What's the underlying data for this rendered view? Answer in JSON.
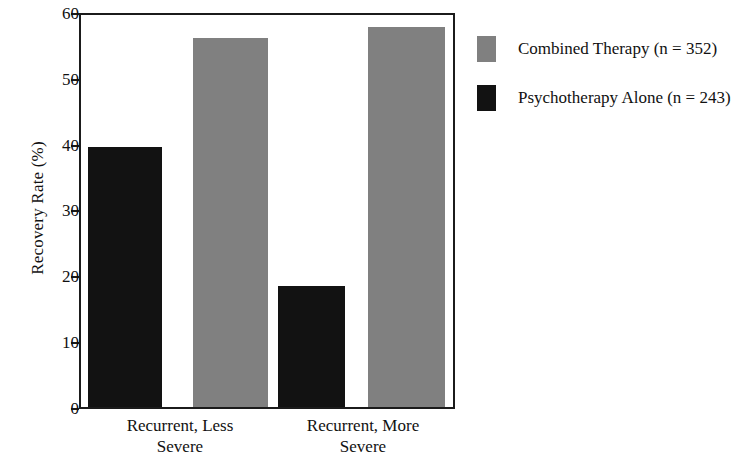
{
  "chart_data": {
    "type": "bar",
    "title": "",
    "xlabel": "",
    "ylabel": "Recovery Rate (%)",
    "categories": [
      "Recurrent, Less Severe",
      "Recurrent, More Severe"
    ],
    "category_lines": [
      [
        "Recurrent, Less",
        "Severe"
      ],
      [
        "Recurrent, More",
        "Severe"
      ]
    ],
    "series": [
      {
        "name": "Combined Therapy (n = 352)",
        "color": "#808080",
        "values": [
          56.5,
          58.2
        ]
      },
      {
        "name": "Psychotherapy Alone (n = 243)",
        "color": "#121212",
        "values": [
          39.8,
          18.5
        ]
      }
    ],
    "ylim": [
      0,
      60
    ],
    "yticks": [
      0,
      10,
      20,
      30,
      40,
      50,
      60
    ],
    "ytick_labels": [
      "0",
      "10",
      "20",
      "30",
      "40",
      "50",
      "60"
    ],
    "grid": false,
    "legend_position": "right",
    "frame": true
  },
  "legend": {
    "entries": [
      {
        "label": "Combined Therapy (n = 352)",
        "swatch": "gray"
      },
      {
        "label": "Psychotherapy Alone (n = 243)",
        "swatch": "black"
      }
    ]
  }
}
